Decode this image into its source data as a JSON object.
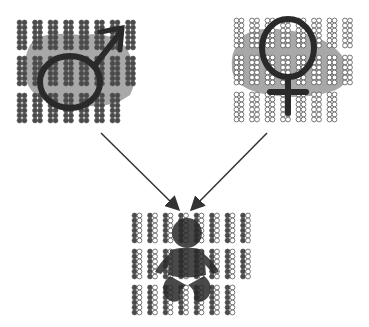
{
  "diagram": {
    "nodes": [
      {
        "id": "father",
        "symbol": "male-symbol",
        "chromosome_style": "dark",
        "rows": [
          8,
          8,
          7
        ]
      },
      {
        "id": "mother",
        "symbol": "female-symbol",
        "chromosome_style": "light",
        "rows": [
          8,
          8,
          7
        ]
      },
      {
        "id": "child",
        "symbol": "baby",
        "chromosome_style": "mixed",
        "rows": [
          8,
          8,
          7
        ]
      }
    ],
    "edges": [
      {
        "from": "father",
        "to": "child"
      },
      {
        "from": "mother",
        "to": "child"
      }
    ],
    "colors": {
      "dark_chromosome": "#4a4a4a",
      "light_chromosome": "#ffffff",
      "outline": "#555555",
      "blob": "#a8a8a8",
      "symbol": "#2a2a2a",
      "arrow": "#333333"
    }
  }
}
